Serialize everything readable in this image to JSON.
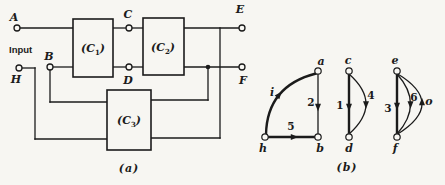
{
  "colors": {
    "ink": "#1b1b1b",
    "paper": "#f7f6f2"
  },
  "part_a": {
    "caption": "(a)",
    "input_label": "Input",
    "terminals": {
      "A": "A",
      "B": "B",
      "C": "C",
      "D": "D",
      "E": "E",
      "F": "F",
      "H": "H"
    },
    "blocks": {
      "c1": {
        "pre": "(C",
        "sub": "1",
        "post": ")"
      },
      "c2": {
        "pre": "(C",
        "sub": "2",
        "post": ")"
      },
      "c3": {
        "pre": "(C",
        "sub": "3",
        "post": ")"
      }
    }
  },
  "part_b": {
    "caption": "(b)",
    "nodes": {
      "a": "a",
      "b": "b",
      "c": "c",
      "d": "d",
      "e": "e",
      "f": "f",
      "h": "h"
    },
    "edges": {
      "i": "i",
      "e2": "2",
      "e5": "5",
      "e1": "1",
      "e4": "4",
      "e3": "3",
      "e6": "6",
      "o": "o"
    }
  }
}
